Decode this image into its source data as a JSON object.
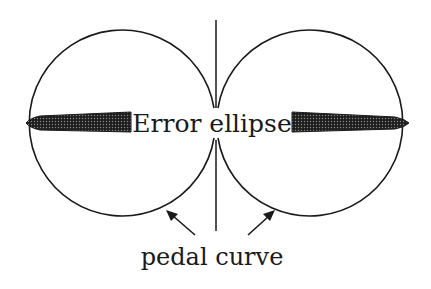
{
  "diagram": {
    "labels": {
      "center": "Error ellipse",
      "bottom": "pedal curve"
    },
    "colors": {
      "stroke": "#1a1a1a",
      "background": "#ffffff",
      "ellipse_fill": "#2a2a2a"
    },
    "elements": {
      "left_circle": {
        "cx": 121,
        "cy": 123,
        "r": 93
      },
      "right_circle": {
        "cx": 313,
        "cy": 123,
        "r": 93
      },
      "axis_line": {
        "x": 216,
        "y1": 20,
        "y2": 231
      }
    }
  }
}
